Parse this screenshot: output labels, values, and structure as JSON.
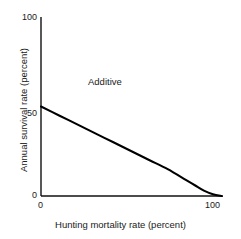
{
  "figure": {
    "background": "#ffffff",
    "axis_color": "#111111",
    "line_color": "#000000"
  },
  "chart_data": {
    "type": "line",
    "title": "",
    "xlabel": "Hunting mortality rate (percent)",
    "ylabel": "Annual survival rate (percent)",
    "xlim": [
      0,
      100
    ],
    "ylim": [
      0,
      100
    ],
    "xticks": [
      0,
      100
    ],
    "xticklabels": [
      "0",
      "100"
    ],
    "yticks": [
      0,
      50,
      100
    ],
    "yticklabels": [
      "0",
      "50",
      "100"
    ],
    "grid": false,
    "legend": null,
    "annotations": [
      {
        "text": "Additive",
        "x": 28,
        "y": 72
      }
    ],
    "series": [
      {
        "name": "Additive mortality relationship",
        "color": "#000000",
        "x": [
          0,
          10,
          20,
          30,
          40,
          50,
          60,
          70,
          80,
          85,
          90,
          95,
          100
        ],
        "y": [
          50,
          45,
          40,
          35,
          30,
          25,
          20,
          15,
          9,
          6,
          3,
          1,
          0
        ]
      }
    ]
  }
}
